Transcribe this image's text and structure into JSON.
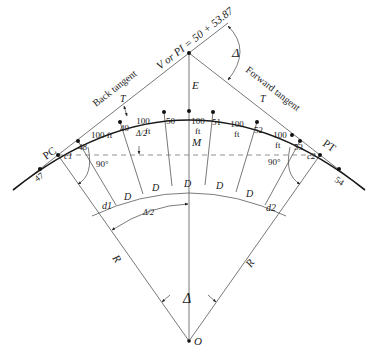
{
  "figure": {
    "vertex_label": "V or PI = 50 + 53.87",
    "delta_symbol": "Δ",
    "center_label": "O",
    "pc_label": "PC",
    "pt_label": "PT",
    "back_tangent_label": "Back tangent",
    "forward_tangent_label": "Forward tangent",
    "tangent_length_label": "T",
    "external_label": "E",
    "middle_ordinate_label": "M",
    "radius_label": "R",
    "right_angle_label": "90°",
    "chord_c1_label": "c1",
    "chord_c2_label": "c2",
    "half_delta_label": "Δ/2",
    "arc_d1_label": "d1",
    "arc_d2_label": "d2",
    "deflection_D_label": "D",
    "stations": [
      "47",
      "48",
      "49",
      "50",
      "51",
      "52",
      "53",
      "54"
    ],
    "chord_lengths": [
      "100 ft",
      "100 ft",
      "100 ft",
      "100 ft",
      "100 ft"
    ],
    "colors": {
      "ink": "#1a1a1a",
      "construction": "#555555",
      "background": "#ffffff"
    }
  }
}
